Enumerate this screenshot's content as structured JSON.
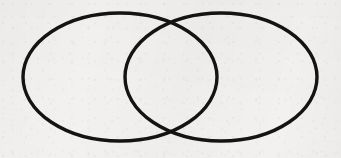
{
  "figure": {
    "kind": "line-drawing",
    "canvas": {
      "width": 341,
      "height": 158,
      "background_color": "#f2f1ef",
      "medium": "scanned paper"
    },
    "stroke": {
      "color": "#131313",
      "width": 3.4
    },
    "shapes": [
      {
        "name": "left-ellipse",
        "type": "ellipse",
        "cx": 120,
        "cy": 77,
        "rx": 97,
        "ry": 64,
        "stroke_width": 3.4
      },
      {
        "name": "right-ellipse",
        "type": "ellipse",
        "cx": 221,
        "cy": 77,
        "rx": 96,
        "ry": 64,
        "stroke_width": 3.4
      }
    ],
    "intersections": [
      {
        "name": "upper-crossing",
        "x": 171,
        "y": 18
      },
      {
        "name": "lower-crossing",
        "x": 171,
        "y": 137
      }
    ],
    "extents": {
      "left_edge_x": 23,
      "right_edge_x": 317,
      "top_edge_y": 13,
      "bottom_edge_y": 141
    }
  }
}
